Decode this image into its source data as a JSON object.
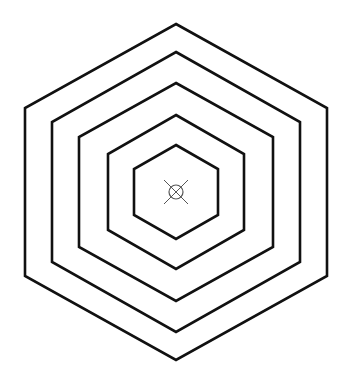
{
  "diagram": {
    "type": "concentric-hexagons",
    "background": "#ffffff",
    "stroke_color": "#111111",
    "center": {
      "x": 176,
      "y": 192
    },
    "hexagons": [
      {
        "name": "hexagon-1-outer",
        "half_width": 151,
        "half_height": 168,
        "side_y_offset": 84
      },
      {
        "name": "hexagon-2",
        "half_width": 124,
        "half_height": 140,
        "side_y_offset": 70
      },
      {
        "name": "hexagon-3",
        "half_width": 97,
        "half_height": 109,
        "side_y_offset": 55
      },
      {
        "name": "hexagon-4",
        "half_width": 68,
        "half_height": 77,
        "side_y_offset": 38
      },
      {
        "name": "hexagon-5-inner",
        "half_width": 42,
        "half_height": 47,
        "side_y_offset": 23
      }
    ],
    "center_marker": {
      "icon": "crossed-circle-marker-icon",
      "color": "#555555",
      "radius": 7,
      "cross_half": 12
    }
  }
}
